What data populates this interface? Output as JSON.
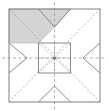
{
  "diagram": {
    "type": "roof-plan",
    "canvas": {
      "width": 109,
      "height": 111,
      "background": "#ffffff"
    },
    "colors": {
      "outline": "#808080",
      "dashed_line": "#9a9a9a",
      "hip_line": "#8a8a8a",
      "shaded_fill": "#d4d4d4",
      "shaded_stroke": "#b0b0b0",
      "center_square_stroke": "#8a8a8a",
      "center_dot": "#707070",
      "background": "#ffffff"
    },
    "outer_boundary": {
      "label": "Outer Roof Perimeter",
      "x": 9,
      "y": 9,
      "width": 91,
      "height": 93,
      "stroke_width": 1
    },
    "center_square": {
      "label": "Ridge Platform",
      "x": 38.5,
      "y": 43,
      "width": 32,
      "height": 30,
      "stroke_width": 1
    },
    "center_point": {
      "label": "Roof Apex",
      "x": 54.5,
      "y": 58,
      "radius": 1.6
    },
    "dashed_diagonals": [
      {
        "label": "diagonal-top-left",
        "x1": 9,
        "y1": 9,
        "x2": 100,
        "y2": 102
      },
      {
        "label": "diagonal-top-right",
        "x1": 100,
        "y1": 9,
        "x2": 9,
        "y2": 102
      }
    ],
    "dashed_axes": [
      {
        "label": "axis-horizontal",
        "x1": 2,
        "y1": 58,
        "x2": 107,
        "y2": 58
      },
      {
        "label": "axis-vertical",
        "x1": 54.5,
        "y1": 2,
        "x2": 54.5,
        "y2": 109
      }
    ],
    "hip_rafters": [
      {
        "label": "hip-top-left",
        "x1": 38.5,
        "y1": 43,
        "x2": 54.5,
        "y2": 58
      },
      {
        "label": "hip-top-right",
        "x1": 70.5,
        "y1": 43,
        "x2": 54.5,
        "y2": 58
      },
      {
        "label": "hip-bottom-left",
        "x1": 38.5,
        "y1": 73,
        "x2": 54.5,
        "y2": 58
      },
      {
        "label": "hip-bottom-right",
        "x1": 70.5,
        "y1": 73,
        "x2": 54.5,
        "y2": 58
      }
    ],
    "valley_vees": [
      {
        "label": "valley-top",
        "points": "38.5,9 54.5,27 70.5,9"
      },
      {
        "label": "valley-bottom",
        "points": "38.5,102 54.5,86 70.5,102"
      },
      {
        "label": "valley-left",
        "points": "9,43 27,58 9,73"
      },
      {
        "label": "valley-right",
        "points": "100,43 83,58 100,73"
      }
    ],
    "shaded_region": {
      "label": "Highlighted Roof Plane",
      "points": "9,9 70.5,9 54.5,27 38.5,43 38.5,43 9,43",
      "fill": "#d4d4d4",
      "opacity": 1
    },
    "stroke_widths": {
      "outline": 1,
      "dashed": 0.8,
      "hip": 1,
      "valley": 1
    },
    "dash_patterns": {
      "diagonal": "2,2",
      "axis": "3,2.5"
    }
  }
}
